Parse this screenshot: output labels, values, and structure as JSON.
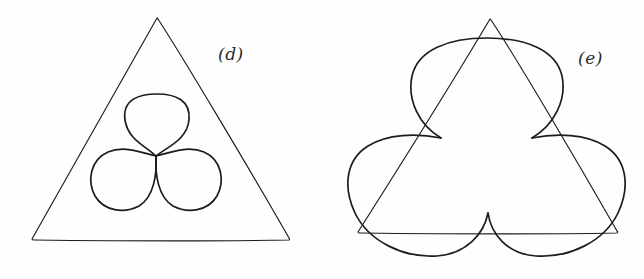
{
  "page": {
    "background_color": "#fefefe",
    "ink_color": "#1c1c1c",
    "width": 644,
    "height": 279
  },
  "figures": [
    {
      "id": "figure-d",
      "label": "(d)",
      "description": "Equilateral triangle enclosing a three-petal trefoil (three circles meeting at a common center point)",
      "triangle": {
        "apex": [
          157,
          18
        ],
        "bottom_left": [
          31,
          240
        ],
        "bottom_right": [
          290,
          240
        ]
      },
      "trefoil": {
        "center": [
          156,
          156
        ],
        "petal_count": 3,
        "petal_radius": 33,
        "petal_centers": [
          [
            156,
            124
          ],
          [
            128,
            178
          ],
          [
            184,
            178
          ]
        ]
      }
    },
    {
      "id": "figure-e",
      "label": "(e)",
      "description": "Equilateral triangle with three outward circular arcs bulging from each edge, forming cusps where arcs meet outside the triangle vertices",
      "triangle": {
        "apex": [
          490,
          19
        ],
        "bottom_left": [
          357,
          233
        ],
        "bottom_right": [
          618,
          233
        ]
      },
      "cusps": {
        "upper_left": [
          441,
          138
        ],
        "upper_right": [
          532,
          138
        ],
        "bottom": [
          488,
          213
        ]
      },
      "arc_extents": {
        "left_x": 344,
        "right_x": 632,
        "bottom_y": 258,
        "top_y": 40
      }
    }
  ],
  "labels": {
    "d": "(d)",
    "e": "(e)"
  }
}
